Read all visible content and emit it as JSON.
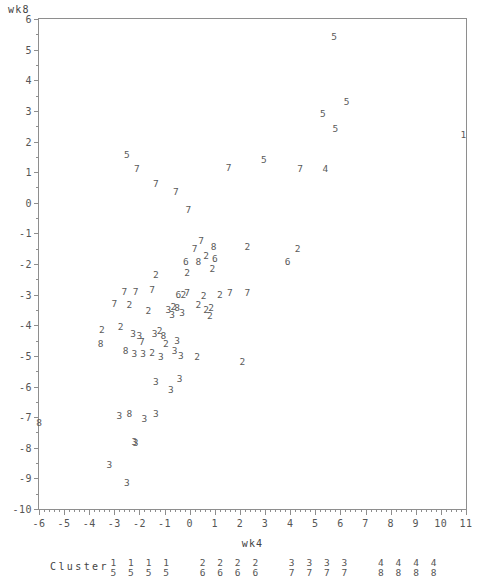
{
  "axes": {
    "ylabel": "wk8",
    "xlabel": "wk4",
    "y_ticks": [
      "6",
      "5",
      "4",
      "3",
      "2",
      "1",
      "0",
      "-1",
      "-2",
      "-3",
      "-4",
      "-5",
      "-6",
      "-7",
      "-8",
      "-9",
      "-10"
    ],
    "x_ticks": [
      "-6",
      "-5",
      "-4",
      "-3",
      "-2",
      "-1",
      "0",
      "1",
      "2",
      "3",
      "4",
      "5",
      "6",
      "7",
      "8",
      "9",
      "10",
      "11"
    ]
  },
  "legend": {
    "title": "Cluster",
    "pairs": [
      {
        "top": "1",
        "bottom": "5"
      },
      {
        "top": "1",
        "bottom": "5"
      },
      {
        "top": "1",
        "bottom": "5"
      },
      {
        "top": "1",
        "bottom": "5"
      },
      {
        "top": "2",
        "bottom": "6"
      },
      {
        "top": "2",
        "bottom": "6"
      },
      {
        "top": "2",
        "bottom": "6"
      },
      {
        "top": "2",
        "bottom": "6"
      },
      {
        "top": "3",
        "bottom": "7"
      },
      {
        "top": "3",
        "bottom": "7"
      },
      {
        "top": "3",
        "bottom": "7"
      },
      {
        "top": "3",
        "bottom": "7"
      },
      {
        "top": "4",
        "bottom": "8"
      },
      {
        "top": "4",
        "bottom": "8"
      },
      {
        "top": "4",
        "bottom": "8"
      },
      {
        "top": "4",
        "bottom": "8"
      }
    ]
  },
  "chart_data": {
    "type": "scatter",
    "title": "",
    "xlabel": "wk4",
    "ylabel": "wk8",
    "xlim": [
      -6,
      11
    ],
    "ylim": [
      -10,
      6
    ],
    "grid": false,
    "marker_encoding": "cluster number drawn as text glyph",
    "points": [
      {
        "x": 5.75,
        "y": 5.4,
        "label": "5"
      },
      {
        "x": 6.25,
        "y": 3.3,
        "label": "5"
      },
      {
        "x": 5.3,
        "y": 2.9,
        "label": "5"
      },
      {
        "x": 5.8,
        "y": 2.4,
        "label": "5"
      },
      {
        "x": 10.9,
        "y": 2.2,
        "label": "1"
      },
      {
        "x": -2.5,
        "y": 1.55,
        "label": "5"
      },
      {
        "x": 2.95,
        "y": 1.4,
        "label": "5"
      },
      {
        "x": -2.1,
        "y": 1.1,
        "label": "7"
      },
      {
        "x": 1.55,
        "y": 1.15,
        "label": "7"
      },
      {
        "x": 4.4,
        "y": 1.1,
        "label": "7"
      },
      {
        "x": 5.4,
        "y": 1.1,
        "label": "4"
      },
      {
        "x": -1.35,
        "y": 0.6,
        "label": "7"
      },
      {
        "x": -0.55,
        "y": 0.35,
        "label": "7"
      },
      {
        "x": -0.05,
        "y": -0.25,
        "label": "7"
      },
      {
        "x": 0.45,
        "y": -1.25,
        "label": "7"
      },
      {
        "x": 0.2,
        "y": -1.5,
        "label": "7"
      },
      {
        "x": 0.95,
        "y": -1.45,
        "label": "8"
      },
      {
        "x": 2.3,
        "y": -1.45,
        "label": "2"
      },
      {
        "x": 4.3,
        "y": -1.5,
        "label": "2"
      },
      {
        "x": 0.65,
        "y": -1.75,
        "label": "2"
      },
      {
        "x": 1.0,
        "y": -1.85,
        "label": "6"
      },
      {
        "x": -0.15,
        "y": -1.95,
        "label": "6"
      },
      {
        "x": 0.35,
        "y": -1.95,
        "label": "8"
      },
      {
        "x": 0.9,
        "y": -2.15,
        "label": "2"
      },
      {
        "x": 3.9,
        "y": -1.95,
        "label": "6"
      },
      {
        "x": -1.35,
        "y": -2.35,
        "label": "2"
      },
      {
        "x": -0.1,
        "y": -2.3,
        "label": "2"
      },
      {
        "x": -2.6,
        "y": -2.9,
        "label": "7"
      },
      {
        "x": -2.15,
        "y": -2.9,
        "label": "7"
      },
      {
        "x": -1.5,
        "y": -2.85,
        "label": "7"
      },
      {
        "x": -0.45,
        "y": -3.0,
        "label": "6"
      },
      {
        "x": -0.25,
        "y": -3.0,
        "label": "2"
      },
      {
        "x": -0.1,
        "y": -2.95,
        "label": "7"
      },
      {
        "x": 0.55,
        "y": -3.05,
        "label": "2"
      },
      {
        "x": 1.2,
        "y": -3.0,
        "label": "2"
      },
      {
        "x": 1.6,
        "y": -2.95,
        "label": "7"
      },
      {
        "x": 2.3,
        "y": -2.95,
        "label": "7"
      },
      {
        "x": 0.35,
        "y": -3.35,
        "label": "2"
      },
      {
        "x": -3.0,
        "y": -3.3,
        "label": "7"
      },
      {
        "x": -2.4,
        "y": -3.35,
        "label": "2"
      },
      {
        "x": -1.65,
        "y": -3.55,
        "label": "2"
      },
      {
        "x": -0.85,
        "y": -3.5,
        "label": "3"
      },
      {
        "x": -0.65,
        "y": -3.4,
        "label": "2"
      },
      {
        "x": -0.5,
        "y": -3.45,
        "label": "8"
      },
      {
        "x": -0.7,
        "y": -3.65,
        "label": "3"
      },
      {
        "x": -0.3,
        "y": -3.6,
        "label": "3"
      },
      {
        "x": 0.65,
        "y": -3.5,
        "label": "2"
      },
      {
        "x": 0.85,
        "y": -3.45,
        "label": "2"
      },
      {
        "x": 0.8,
        "y": -3.7,
        "label": "2"
      },
      {
        "x": -3.5,
        "y": -4.15,
        "label": "2"
      },
      {
        "x": -2.75,
        "y": -4.05,
        "label": "2"
      },
      {
        "x": -2.25,
        "y": -4.3,
        "label": "3"
      },
      {
        "x": -2.0,
        "y": -4.35,
        "label": "3"
      },
      {
        "x": -1.4,
        "y": -4.3,
        "label": "3"
      },
      {
        "x": -1.2,
        "y": -4.2,
        "label": "2"
      },
      {
        "x": -1.9,
        "y": -4.55,
        "label": "7"
      },
      {
        "x": -0.95,
        "y": -4.6,
        "label": "2"
      },
      {
        "x": -0.5,
        "y": -4.5,
        "label": "3"
      },
      {
        "x": -1.05,
        "y": -4.35,
        "label": "8"
      },
      {
        "x": -3.55,
        "y": -4.6,
        "label": "8"
      },
      {
        "x": -2.55,
        "y": -4.85,
        "label": "8"
      },
      {
        "x": -2.2,
        "y": -4.95,
        "label": "3"
      },
      {
        "x": -1.85,
        "y": -4.95,
        "label": "3"
      },
      {
        "x": -1.5,
        "y": -4.9,
        "label": "2"
      },
      {
        "x": -0.6,
        "y": -4.85,
        "label": "3"
      },
      {
        "x": -1.15,
        "y": -5.05,
        "label": "3"
      },
      {
        "x": -0.35,
        "y": -5.0,
        "label": "3"
      },
      {
        "x": 0.3,
        "y": -5.05,
        "label": "2"
      },
      {
        "x": 2.1,
        "y": -5.2,
        "label": "2"
      },
      {
        "x": -1.35,
        "y": -5.85,
        "label": "3"
      },
      {
        "x": -0.75,
        "y": -6.1,
        "label": "3"
      },
      {
        "x": -0.4,
        "y": -5.75,
        "label": "3"
      },
      {
        "x": -2.8,
        "y": -6.95,
        "label": "3"
      },
      {
        "x": -2.4,
        "y": -6.9,
        "label": "8"
      },
      {
        "x": -1.8,
        "y": -7.05,
        "label": "3"
      },
      {
        "x": -1.35,
        "y": -6.9,
        "label": "3"
      },
      {
        "x": -6.0,
        "y": -7.2,
        "label": "8"
      },
      {
        "x": -2.2,
        "y": -7.8,
        "label": "3"
      },
      {
        "x": -2.15,
        "y": -7.85,
        "label": "3"
      },
      {
        "x": -3.2,
        "y": -8.55,
        "label": "3"
      },
      {
        "x": -2.5,
        "y": -9.15,
        "label": "3"
      }
    ]
  }
}
